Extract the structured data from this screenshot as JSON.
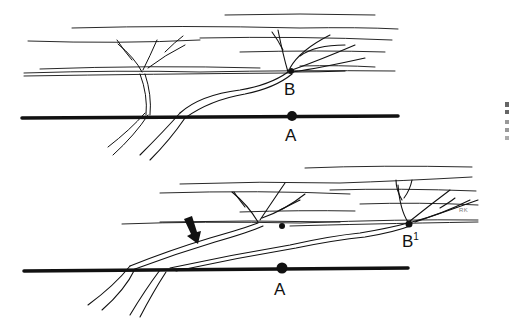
{
  "figure": {
    "top_panel": {
      "labels": {
        "point_b": "B",
        "point_a": "A"
      }
    },
    "bottom_panel": {
      "labels": {
        "point_b1_base": "B",
        "point_b1_sup": "1",
        "point_a": "A"
      },
      "signature": "RK",
      "arrow": "down-right-arrow"
    }
  },
  "colors": {
    "ink": "#111111",
    "background": "#ffffff"
  }
}
